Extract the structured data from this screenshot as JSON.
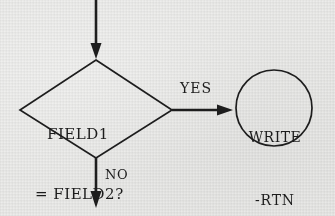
{
  "diagram": {
    "type": "flowchart",
    "title": "",
    "background_color": "#e9e9e7",
    "ink_color": "#1d1d1d",
    "nodes": [
      {
        "id": "decision",
        "shape": "diamond",
        "text_line_1": "FIELD1",
        "text_line_2": "= FIELD2?"
      },
      {
        "id": "terminal",
        "shape": "circle",
        "text_line_1": "WRITE",
        "text_line_2": "-RTN"
      }
    ],
    "edges": [
      {
        "id": "entry",
        "label": "",
        "direction": "down",
        "from": "top-of-page",
        "to": "decision"
      },
      {
        "id": "yes-branch",
        "label": "YES",
        "direction": "right",
        "from": "decision",
        "to": "terminal"
      },
      {
        "id": "no-branch",
        "label": "NO",
        "direction": "down",
        "from": "decision",
        "to": "bottom-of-page"
      }
    ]
  }
}
